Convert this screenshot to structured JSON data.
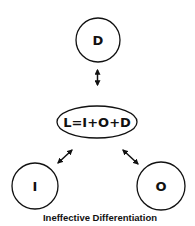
{
  "diagram": {
    "caption": "Ineffective Differentiation",
    "center": {
      "label": "L=I+O+D"
    },
    "nodes": [
      {
        "id": "D",
        "label": "D"
      },
      {
        "id": "I",
        "label": "I"
      },
      {
        "id": "O",
        "label": "O"
      }
    ],
    "edges": [
      {
        "from": "L",
        "to": "D",
        "type": "bidirectional"
      },
      {
        "from": "L",
        "to": "I",
        "type": "bidirectional"
      },
      {
        "from": "L",
        "to": "O",
        "type": "bidirectional"
      }
    ],
    "colors": {
      "stroke": "#111111",
      "background": "#ffffff"
    }
  }
}
